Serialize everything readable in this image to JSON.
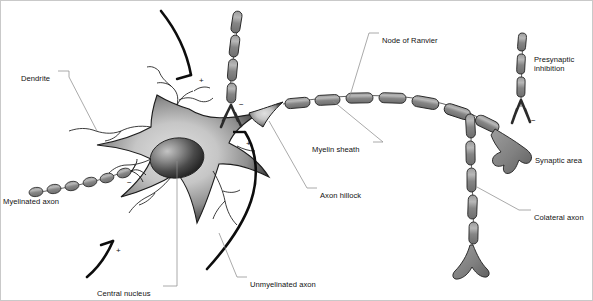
{
  "figure": {
    "background_color": "#ffffff",
    "border_color": "#c9c9c9",
    "ink_color": "#111111",
    "myelin_fill": "#8a8a8a",
    "myelin_highlight": "#b4b4b4",
    "soma_fill_light": "#d2d2d2",
    "soma_fill_dark": "#3a3a3a",
    "nucleus_dark": "#2e2e2e",
    "nucleus_highlight": "#b9b9b9",
    "leader_color": "#8d8d8d"
  },
  "labels": [
    {
      "id": "dendrite",
      "text": "Dendrite",
      "x": 20,
      "y": 73
    },
    {
      "id": "myelinated-axon",
      "text": "Myelinated axon",
      "x": 2,
      "y": 196
    },
    {
      "id": "central-nucleus",
      "text": "Central nucleus",
      "x": 96,
      "y": 288
    },
    {
      "id": "unmyelinated-axon",
      "text": "Unmyelinated axon",
      "x": 249,
      "y": 279
    },
    {
      "id": "axon-hillock",
      "text": "Axon hillock",
      "x": 319,
      "y": 190
    },
    {
      "id": "myelin-sheath",
      "text": "Myelin sheath",
      "x": 311,
      "y": 144
    },
    {
      "id": "node-of-ranvier",
      "text": "Node of Ranvier",
      "x": 381,
      "y": 35
    },
    {
      "id": "synaptic-area",
      "text": "Synaptic area",
      "x": 534,
      "y": 155
    },
    {
      "id": "colateral-axon",
      "text": "Colateral axon",
      "x": 533,
      "y": 212
    }
  ],
  "multiline_labels": [
    {
      "id": "presynaptic-inhibition",
      "line1": "Presynaptic",
      "line2": "inhibition",
      "x": 533,
      "y": 54
    }
  ],
  "signs": [
    {
      "id": "sign-plus-top-dendrite",
      "text": "+",
      "x": 198,
      "y": 76
    },
    {
      "id": "sign-minus-diagonal-axon",
      "text": "−",
      "x": 238,
      "y": 100
    },
    {
      "id": "sign-plus-hillock",
      "text": "+",
      "x": 245,
      "y": 139
    },
    {
      "id": "sign-minus-left-axon",
      "text": "−",
      "x": 126,
      "y": 178
    },
    {
      "id": "sign-plus-bottom-dendrite",
      "text": "+",
      "x": 115,
      "y": 246
    },
    {
      "id": "sign-minus-presynaptic",
      "text": "−",
      "x": 530,
      "y": 116
    }
  ],
  "structures": {
    "soma": "star-shaped cell body with radial gradient shading",
    "nucleus": "dark ellipse with upper-left highlight",
    "myelinated_axon_left": "chain of 6 small elliptical myelin segments entering soma from left",
    "diagonal_myelinated_axon": "angled myelinated fiber from top ending in Y branch",
    "main_axon": "myelinated axon arcing right with nodes of Ranvier",
    "collateral_axon": "descending myelinated branch ending in three-pronged terminal",
    "synaptic_terminal": "claw-shaped synaptic bouton",
    "presynaptic_fiber": "vertical myelinated fiber ending in Y-shaped terminal",
    "unmyelinated_axon": "thick smooth black fiber curving below soma",
    "dendrites": "thin branching fibers radiating from soma"
  }
}
